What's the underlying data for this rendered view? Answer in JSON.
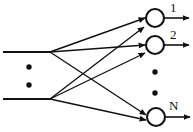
{
  "diagram": {
    "type": "neural-network-fanout",
    "title": "",
    "stroke_color": "#111111",
    "background_color": "#ffffff",
    "node_fill": "#ffffff",
    "inputs": [
      {
        "id": "input-1",
        "x1": 3,
        "y1": 52,
        "x2": 50,
        "y2": 52
      },
      {
        "id": "input-2",
        "x1": 3,
        "y1": 99,
        "x2": 50,
        "y2": 99
      }
    ],
    "fanout_nodes": [
      {
        "id": "fanout-top",
        "x": 50,
        "y": 52
      },
      {
        "id": "fanout-bottom",
        "x": 50,
        "y": 99
      }
    ],
    "neurons": [
      {
        "id": "neuron-1",
        "cx": 155,
        "cy": 18,
        "r": 9,
        "label": "1"
      },
      {
        "id": "neuron-2",
        "cx": 155,
        "cy": 45,
        "r": 9,
        "label": "2"
      },
      {
        "id": "neuron-n",
        "cx": 156,
        "cy": 117,
        "r": 9,
        "label": "N"
      }
    ],
    "connections": [
      {
        "from": "fanout-top",
        "to": "neuron-1"
      },
      {
        "from": "fanout-top",
        "to": "neuron-2"
      },
      {
        "from": "fanout-top",
        "to": "neuron-n"
      },
      {
        "from": "fanout-bottom",
        "to": "neuron-1"
      },
      {
        "from": "fanout-bottom",
        "to": "neuron-2"
      },
      {
        "from": "fanout-bottom",
        "to": "neuron-n"
      }
    ],
    "input_ellipsis": {
      "orientation": "vertical",
      "dots": [
        {
          "cx": 29,
          "cy": 67,
          "r": 2.6
        },
        {
          "cx": 29,
          "cy": 85,
          "r": 2.6
        }
      ]
    },
    "output_ellipsis": {
      "orientation": "vertical",
      "dots": [
        {
          "cx": 155,
          "cy": 72,
          "r": 2.6
        },
        {
          "cx": 155,
          "cy": 93,
          "r": 2.6
        }
      ]
    },
    "outputs": [
      {
        "id": "output-1",
        "label": "1",
        "x1": 164,
        "y1": 18,
        "x2": 189,
        "y2": 18,
        "label_x": 170,
        "label_y": 2
      },
      {
        "id": "output-2",
        "label": "2",
        "x1": 164,
        "y1": 45,
        "x2": 189,
        "y2": 45,
        "label_x": 170,
        "label_y": 29
      },
      {
        "id": "output-n",
        "label": "N",
        "x1": 165,
        "y1": 117,
        "x2": 190,
        "y2": 117,
        "label_x": 169,
        "label_y": 100
      }
    ]
  }
}
